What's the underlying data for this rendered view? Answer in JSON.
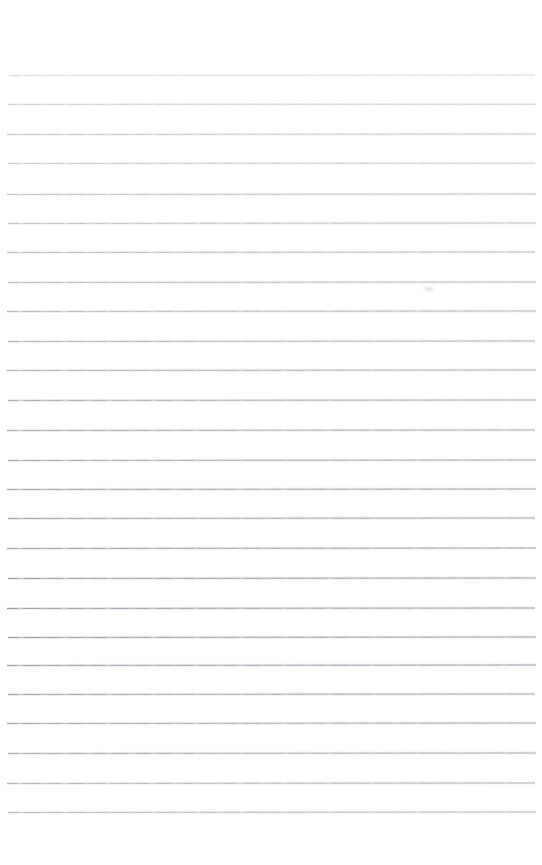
{
  "document": {
    "kind": "scanned-ruled-paper",
    "title": "Blank Lined Paper",
    "background_color": "#ffffff",
    "page_width": 542,
    "page_height": 865,
    "text_content": "",
    "has_handwriting": false,
    "has_printed_text": false
  },
  "ruling": {
    "label": "Horizontal ruled lines",
    "line_count": 26,
    "first_line_y": 75,
    "line_spacing": 29.4,
    "line_left_x": 7,
    "line_right_x": 536,
    "line_thickness": 1,
    "base_color": "#b4b4bb",
    "lightest_color": "#d9d9de",
    "darkest_color": "#9a9aa3",
    "top_margin": 75,
    "bottom_margin": 53,
    "lines": [
      {
        "index": 1,
        "y": 75,
        "x1": 9,
        "x2": 535,
        "color": "#d4d4d9",
        "opacity": 0.72,
        "tilt": -0.05
      },
      {
        "index": 2,
        "y": 104,
        "x1": 8,
        "x2": 536,
        "color": "#c6c6cd",
        "opacity": 0.8,
        "tilt": -0.04
      },
      {
        "index": 3,
        "y": 134,
        "x1": 7,
        "x2": 536,
        "color": "#c0c0c8",
        "opacity": 0.84,
        "tilt": -0.05
      },
      {
        "index": 4,
        "y": 163,
        "x1": 8,
        "x2": 535,
        "color": "#c2c2ca",
        "opacity": 0.82,
        "tilt": -0.04
      },
      {
        "index": 5,
        "y": 194,
        "x1": 7,
        "x2": 536,
        "color": "#bcbcc4",
        "opacity": 0.86,
        "tilt": -0.05
      },
      {
        "index": 6,
        "y": 223,
        "x1": 8,
        "x2": 536,
        "color": "#bababf",
        "opacity": 0.86,
        "tilt": -0.05
      },
      {
        "index": 7,
        "y": 252,
        "x1": 7,
        "x2": 535,
        "color": "#b6b6bd",
        "opacity": 0.88,
        "tilt": -0.06
      },
      {
        "index": 8,
        "y": 282,
        "x1": 8,
        "x2": 536,
        "color": "#b4b4bb",
        "opacity": 0.88,
        "tilt": -0.05
      },
      {
        "index": 9,
        "y": 311,
        "x1": 7,
        "x2": 536,
        "color": "#b2b2b9",
        "opacity": 0.9,
        "tilt": -0.05
      },
      {
        "index": 10,
        "y": 341,
        "x1": 8,
        "x2": 535,
        "color": "#aeaeb6",
        "opacity": 0.9,
        "tilt": -0.06
      },
      {
        "index": 11,
        "y": 370,
        "x1": 7,
        "x2": 536,
        "color": "#acacb4",
        "opacity": 0.91,
        "tilt": -0.05
      },
      {
        "index": 12,
        "y": 400,
        "x1": 8,
        "x2": 536,
        "color": "#a8a8b1",
        "opacity": 0.92,
        "tilt": -0.05
      },
      {
        "index": 13,
        "y": 430,
        "x1": 7,
        "x2": 535,
        "color": "#a8a8b0",
        "opacity": 0.92,
        "tilt": -0.06
      },
      {
        "index": 14,
        "y": 460,
        "x1": 8,
        "x2": 536,
        "color": "#a6a6af",
        "opacity": 0.93,
        "tilt": -0.05
      },
      {
        "index": 15,
        "y": 489,
        "x1": 7,
        "x2": 536,
        "color": "#a4a4ae",
        "opacity": 0.93,
        "tilt": -0.05
      },
      {
        "index": 16,
        "y": 518,
        "x1": 8,
        "x2": 535,
        "color": "#a2a2ac",
        "opacity": 0.94,
        "tilt": -0.06
      },
      {
        "index": 17,
        "y": 548,
        "x1": 7,
        "x2": 536,
        "color": "#a0a0ab",
        "opacity": 0.94,
        "tilt": -0.05
      },
      {
        "index": 18,
        "y": 578,
        "x1": 8,
        "x2": 536,
        "color": "#9e9ea9",
        "opacity": 0.95,
        "tilt": -0.05
      },
      {
        "index": 19,
        "y": 608,
        "x1": 7,
        "x2": 535,
        "color": "#9c9ca7",
        "opacity": 0.95,
        "tilt": -0.06
      },
      {
        "index": 20,
        "y": 637,
        "x1": 8,
        "x2": 536,
        "color": "#9e9ea9",
        "opacity": 0.95,
        "tilt": -0.05
      },
      {
        "index": 21,
        "y": 665,
        "x1": 7,
        "x2": 536,
        "color": "#a0a0ab",
        "opacity": 0.94,
        "tilt": -0.05
      },
      {
        "index": 22,
        "y": 694,
        "x1": 8,
        "x2": 535,
        "color": "#a2a2ac",
        "opacity": 0.94,
        "tilt": -0.06
      },
      {
        "index": 23,
        "y": 723,
        "x1": 7,
        "x2": 536,
        "color": "#a6a6af",
        "opacity": 0.93,
        "tilt": -0.05
      },
      {
        "index": 24,
        "y": 753,
        "x1": 8,
        "x2": 536,
        "color": "#aaaab3",
        "opacity": 0.92,
        "tilt": -0.05
      },
      {
        "index": 25,
        "y": 783,
        "x1": 7,
        "x2": 535,
        "color": "#aeaeb6",
        "opacity": 0.9,
        "tilt": -0.06
      },
      {
        "index": 26,
        "y": 812,
        "x1": 8,
        "x2": 536,
        "color": "#b2b2ba",
        "opacity": 0.88,
        "tilt": -0.05
      }
    ]
  },
  "artifacts": [
    {
      "name": "scan-smudge",
      "description": "faint gray smudge just below line 8",
      "x": 424,
      "y": 287,
      "width": 9,
      "height": 4,
      "color": "#dcdce1"
    }
  ]
}
